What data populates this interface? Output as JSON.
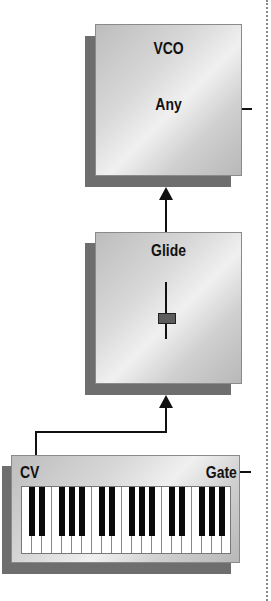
{
  "diagram": {
    "vco": {
      "title": "VCO",
      "subtitle": "Any"
    },
    "glide": {
      "title": "Glide",
      "control": "slider"
    },
    "keyboard": {
      "cv_label": "CV",
      "gate_label": "Gate",
      "white_keys": 21,
      "octaves": 3
    },
    "connections": [
      {
        "from": "keyboard.CV",
        "to": "glide"
      },
      {
        "from": "glide",
        "to": "vco"
      }
    ],
    "colors": {
      "box_shadow": "#6e6e6e",
      "line": "#111111",
      "knob": "#5d5d5d"
    }
  }
}
